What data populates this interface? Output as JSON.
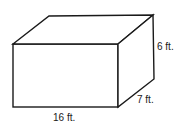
{
  "diagram": {
    "type": "rectangular-prism",
    "dimensions": {
      "length": "16 ft.",
      "width": "7 ft.",
      "height": "6 ft."
    },
    "stroke_color": "#1a1a1a",
    "fill_color": "#ffffff"
  }
}
